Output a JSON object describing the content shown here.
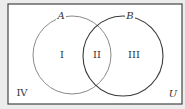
{
  "diagram": {
    "type": "venn",
    "universe_label": "U",
    "sets": [
      {
        "name": "A",
        "stroke": "#8a8a8a"
      },
      {
        "name": "B",
        "stroke": "#3a3a3a"
      }
    ],
    "regions": [
      {
        "id": "I",
        "label": "I",
        "description": "A only"
      },
      {
        "id": "II",
        "label": "II",
        "description": "A and B"
      },
      {
        "id": "III",
        "label": "III",
        "description": "B only"
      },
      {
        "id": "IV",
        "label": "IV",
        "description": "neither A nor B"
      }
    ],
    "colors": {
      "background": "#ececec",
      "universe_fill": "#ffffff",
      "border": "#444444"
    }
  }
}
